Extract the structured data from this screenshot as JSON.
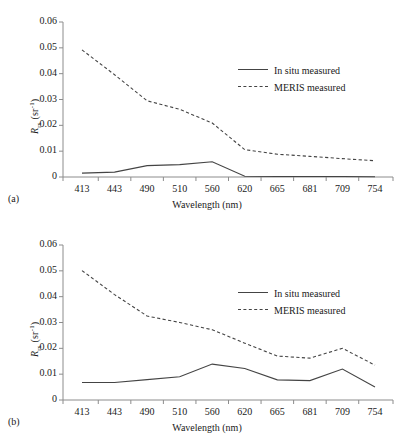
{
  "figure": {
    "background": "#ffffff",
    "line_color": "#444444",
    "axis_color": "#8c8c8c"
  },
  "panels": [
    {
      "tag": "(a)",
      "tag_name": "panel-a-tag"
    },
    {
      "tag": "(b)",
      "tag_name": "panel-b-tag"
    }
  ],
  "axis": {
    "xlabel": "Wavelength (nm)",
    "ylabel_base": "R",
    "ylabel_sub": "rs",
    "ylabel_unit_open": " (sr",
    "ylabel_sup": "-1",
    "ylabel_unit_close": ")",
    "xticks": [
      "413",
      "443",
      "490",
      "510",
      "560",
      "620",
      "665",
      "681",
      "709",
      "754"
    ],
    "yticks": [
      "0",
      "0.01",
      "0.02",
      "0.03",
      "0.04",
      "0.05",
      "0.06"
    ]
  },
  "legend": {
    "entries": [
      {
        "label": "In situ measured",
        "style": "solid"
      },
      {
        "label": "MERIS measured",
        "style": "dashed"
      }
    ]
  },
  "chart_data": [
    {
      "type": "line",
      "title": "(a)",
      "xlabel": "Wavelength (nm)",
      "ylabel": "Rrs (sr^-1)",
      "x": [
        413,
        443,
        490,
        510,
        560,
        620,
        665,
        681,
        709,
        754
      ],
      "categories": [
        "413",
        "443",
        "490",
        "510",
        "560",
        "620",
        "665",
        "681",
        "709",
        "754"
      ],
      "xlim": [
        413,
        754
      ],
      "ylim": [
        0,
        0.06
      ],
      "ytick_step": 0.01,
      "grid": false,
      "legend_position": "upper-right-inside",
      "series": [
        {
          "name": "In situ measured",
          "style": "solid",
          "values": [
            0.0015,
            0.0019,
            0.0044,
            0.0048,
            0.0059,
            0.0003,
            0.0002,
            0.0002,
            0.0002,
            0.0001
          ]
        },
        {
          "name": "MERIS measured",
          "style": "dashed",
          "values": [
            0.0492,
            0.0396,
            0.0295,
            0.0262,
            0.0209,
            0.0106,
            0.0088,
            0.008,
            0.0071,
            0.0063
          ]
        }
      ]
    },
    {
      "type": "line",
      "title": "(b)",
      "xlabel": "Wavelength (nm)",
      "ylabel": "Rrs (sr^-1)",
      "x": [
        413,
        443,
        490,
        510,
        560,
        620,
        665,
        681,
        709,
        754
      ],
      "categories": [
        "413",
        "443",
        "490",
        "510",
        "560",
        "620",
        "665",
        "681",
        "709",
        "754"
      ],
      "xlim": [
        413,
        754
      ],
      "ylim": [
        0,
        0.06
      ],
      "ytick_step": 0.01,
      "grid": false,
      "legend_position": "upper-right-inside",
      "series": [
        {
          "name": "In situ measured",
          "style": "solid",
          "values": [
            0.0068,
            0.0068,
            0.0079,
            0.009,
            0.0139,
            0.0122,
            0.0078,
            0.0075,
            0.012,
            0.005
          ]
        },
        {
          "name": "MERIS measured",
          "style": "dashed",
          "values": [
            0.0501,
            0.0408,
            0.0325,
            0.03,
            0.0272,
            0.022,
            0.017,
            0.0162,
            0.02,
            0.0135
          ]
        }
      ]
    }
  ]
}
